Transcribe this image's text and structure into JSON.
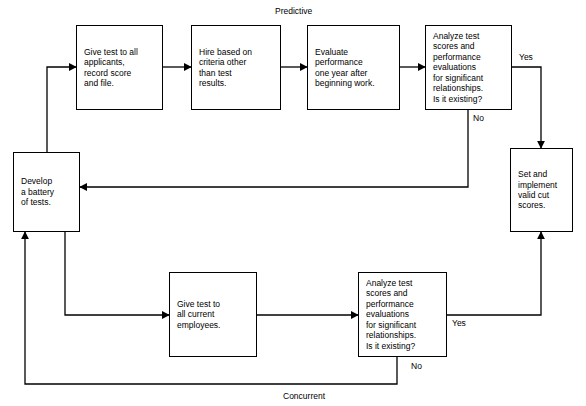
{
  "diagram": {
    "background_color": "#ffffff",
    "line_color": "#000000",
    "path_labels": {
      "predictive": "Predictive",
      "concurrent": "Concurrent"
    },
    "nodes": [
      {
        "id": "develop-battery",
        "text": "Develop\na battery\nof tests.",
        "x": 13,
        "y": 152,
        "w": 67,
        "h": 80
      },
      {
        "id": "give-test-applicants",
        "text": "Give test to all\napplicants,\nrecord score\nand file.",
        "x": 76,
        "y": 25,
        "w": 87,
        "h": 85
      },
      {
        "id": "hire-other-criteria",
        "text": "Hire based on\ncriteria other\nthan test\nresults.",
        "x": 191,
        "y": 25,
        "w": 90,
        "h": 85
      },
      {
        "id": "evaluate-performance",
        "text": "Evaluate\nperformance\none year after\nbeginning work.",
        "x": 307,
        "y": 25,
        "w": 93,
        "h": 85
      },
      {
        "id": "analyze-predictive",
        "text": "Analyze test\nscores and\nperformance\nevaluations\nfor significant\nrelationships.\nIs it existing?",
        "x": 425,
        "y": 25,
        "w": 87,
        "h": 85
      },
      {
        "id": "set-cut-scores",
        "text": "Set and\nimplement\nvalid cut\nscores.",
        "x": 510,
        "y": 148,
        "w": 63,
        "h": 84
      },
      {
        "id": "give-test-employees",
        "text": "Give test to\nall current\nemployees.",
        "x": 169,
        "y": 272,
        "w": 88,
        "h": 85
      },
      {
        "id": "analyze-concurrent",
        "text": "Analyze test\nscores and\nperformance\nevaluations\nfor significant\nrelationships.\nIs it existing?",
        "x": 358,
        "y": 272,
        "w": 89,
        "h": 85
      }
    ],
    "edge_labels": [
      {
        "id": "yes-predictive",
        "text": "Yes",
        "x": 519,
        "y": 52
      },
      {
        "id": "no-predictive",
        "text": "No",
        "x": 473,
        "y": 113
      },
      {
        "id": "yes-concurrent",
        "text": "Yes",
        "x": 452,
        "y": 318
      },
      {
        "id": "no-concurrent",
        "text": "No",
        "x": 411,
        "y": 361
      }
    ]
  }
}
